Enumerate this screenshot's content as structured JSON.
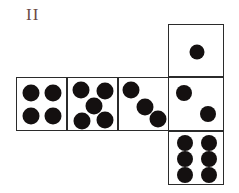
{
  "figure": {
    "label": "II",
    "label_color": "#6b4a45",
    "type": "cube-net-dice",
    "stroke_color": "#2b2b2b",
    "pip_color": "#141010",
    "background": "#ffffff",
    "faces": [
      {
        "id": "face-top",
        "name": "top-face",
        "position": "above-fourth-column",
        "pip_count": 1,
        "pips": [
          {
            "cx": 50,
            "cy": 50,
            "r": 7.5
          }
        ]
      },
      {
        "id": "face-row-1",
        "name": "row-face-1",
        "position": "row-leftmost",
        "pip_count": 4,
        "pips": [
          {
            "cx": 28,
            "cy": 27,
            "r": 8.5
          },
          {
            "cx": 71,
            "cy": 27,
            "r": 8.5
          },
          {
            "cx": 28,
            "cy": 71,
            "r": 8.5
          },
          {
            "cx": 71,
            "cy": 71,
            "r": 8.5
          }
        ]
      },
      {
        "id": "face-row-2",
        "name": "row-face-2",
        "position": "row-second",
        "pip_count": 5,
        "pips": [
          {
            "cx": 26,
            "cy": 22,
            "r": 8.5
          },
          {
            "cx": 73,
            "cy": 24,
            "r": 8.5
          },
          {
            "cx": 50,
            "cy": 52,
            "r": 8.5
          },
          {
            "cx": 27,
            "cy": 80,
            "r": 8.5
          },
          {
            "cx": 73,
            "cy": 78,
            "r": 8.5
          }
        ]
      },
      {
        "id": "face-row-3",
        "name": "row-face-3",
        "position": "row-third",
        "pip_count": 3,
        "pips": [
          {
            "cx": 23,
            "cy": 22,
            "r": 8.5
          },
          {
            "cx": 51,
            "cy": 53,
            "r": 8.5
          },
          {
            "cx": 76,
            "cy": 76,
            "r": 8.5
          }
        ]
      },
      {
        "id": "face-row-4",
        "name": "row-face-4",
        "position": "row-rightmost",
        "pip_count": 2,
        "pips": [
          {
            "cx": 27,
            "cy": 28,
            "r": 8
          },
          {
            "cx": 70,
            "cy": 67,
            "r": 8
          }
        ]
      },
      {
        "id": "face-bottom",
        "name": "bottom-face",
        "position": "below-fourth-column",
        "pip_count": 6,
        "pips": [
          {
            "cx": 29,
            "cy": 21,
            "r": 8
          },
          {
            "cx": 71,
            "cy": 21,
            "r": 8
          },
          {
            "cx": 29,
            "cy": 50,
            "r": 8
          },
          {
            "cx": 71,
            "cy": 50,
            "r": 8
          },
          {
            "cx": 29,
            "cy": 79,
            "r": 8
          },
          {
            "cx": 71,
            "cy": 79,
            "r": 8
          }
        ]
      }
    ]
  }
}
